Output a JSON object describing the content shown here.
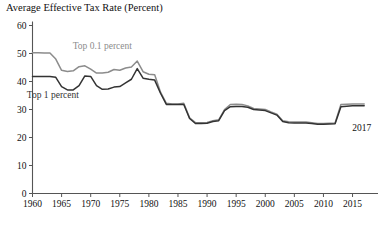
{
  "chart_data": {
    "type": "line",
    "title": "Average Effective Tax Rate (Percent)",
    "xlabel": "",
    "ylabel": "",
    "xlim": [
      1960,
      2018
    ],
    "ylim": [
      0,
      60
    ],
    "grid": false,
    "legend_position": "inline-annotation",
    "yticks": [
      0,
      10,
      20,
      30,
      40,
      50,
      60
    ],
    "ytick_labels": [
      "0",
      "10",
      "20",
      "30",
      "40",
      "50",
      "60"
    ],
    "xticks": [
      1960,
      1965,
      1970,
      1975,
      1980,
      1985,
      1990,
      1995,
      2000,
      2005,
      2010,
      2015
    ],
    "xtick_labels": [
      "1960",
      "1965",
      "1970",
      "1975",
      "1980",
      "1985",
      "1990",
      "1995",
      "2000",
      "2005",
      "2010",
      "2015"
    ],
    "annotations": [
      {
        "text": "2017",
        "x": 2016.6,
        "y": 22.5
      }
    ],
    "colors": {
      "top_01_percent": "#8c8c8c",
      "top_1_percent": "#333333",
      "axis": "#555555"
    },
    "x": [
      1960,
      1961,
      1962,
      1963,
      1964,
      1965,
      1966,
      1967,
      1968,
      1969,
      1970,
      1971,
      1972,
      1973,
      1974,
      1975,
      1976,
      1977,
      1978,
      1979,
      1980,
      1981,
      1982,
      1983,
      1984,
      1985,
      1986,
      1987,
      1988,
      1989,
      1990,
      1991,
      1992,
      1993,
      1994,
      1995,
      1996,
      1997,
      1998,
      1999,
      2000,
      2001,
      2002,
      2003,
      2004,
      2005,
      2006,
      2007,
      2008,
      2009,
      2010,
      2011,
      2012,
      2013,
      2014,
      2015,
      2016,
      2017
    ],
    "series": [
      {
        "name": "Top 0.1 percent",
        "color": "#8c8c8c",
        "label_x": 1972.0,
        "label_y": 51.5,
        "values": [
          50.3,
          50.3,
          50.2,
          50.2,
          48.0,
          44.0,
          43.6,
          43.8,
          45.3,
          45.6,
          44.4,
          43.0,
          43.0,
          43.3,
          44.3,
          44.0,
          44.8,
          45.2,
          47.3,
          43.5,
          42.6,
          42.4,
          36.2,
          32.2,
          32.0,
          32.0,
          32.2,
          27.0,
          25.3,
          25.3,
          25.4,
          26.0,
          26.3,
          30.0,
          31.8,
          31.9,
          31.8,
          31.3,
          30.4,
          30.2,
          30.0,
          29.1,
          28.3,
          26.0,
          25.6,
          25.5,
          25.5,
          25.5,
          25.3,
          25.0,
          25.0,
          25.1,
          25.2,
          31.8,
          31.9,
          32.0,
          32.0,
          32.0
        ]
      },
      {
        "name": "Top 1 percent",
        "color": "#333333",
        "label_x": 1963.5,
        "label_y": 34.0,
        "values": [
          41.8,
          41.8,
          41.8,
          41.8,
          41.5,
          38.2,
          37.0,
          37.0,
          38.5,
          42.0,
          41.8,
          38.5,
          37.2,
          37.3,
          38.0,
          38.2,
          39.5,
          40.8,
          44.6,
          41.2,
          40.8,
          40.5,
          35.8,
          31.8,
          31.8,
          31.8,
          31.8,
          26.8,
          25.0,
          25.0,
          25.1,
          25.7,
          26.0,
          29.6,
          31.0,
          31.1,
          31.1,
          30.8,
          30.0,
          29.8,
          29.6,
          28.8,
          28.0,
          25.7,
          25.3,
          25.2,
          25.2,
          25.2,
          25.0,
          24.7,
          24.7,
          24.8,
          24.9,
          31.0,
          31.2,
          31.3,
          31.3,
          31.3
        ]
      }
    ]
  }
}
